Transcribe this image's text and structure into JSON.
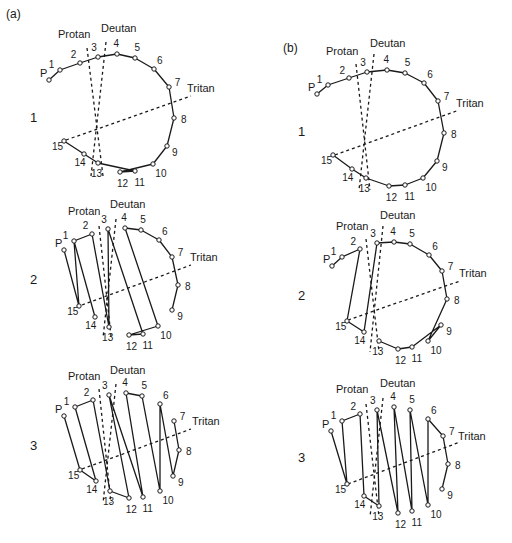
{
  "figure": {
    "panels": [
      {
        "id": "a",
        "label": "(a)",
        "label_pos": [
          6,
          18
        ],
        "plots": [
          {
            "row_label": "1",
            "row_label_pos": [
              30,
              122
            ],
            "points": {
              "P": [
                49,
                80
              ],
              "1": [
                60,
                70
              ],
              "2": [
                80,
                63
              ],
              "3": [
                98,
                57
              ],
              "4": [
                117,
                54
              ],
              "5": [
                135,
                58
              ],
              "6": [
                154,
                69
              ],
              "7": [
                169,
                87
              ],
              "8": [
                174,
                118
              ],
              "9": [
                167,
                146
              ],
              "10": [
                153,
                164
              ],
              "11": [
                135,
                171
              ],
              "12": [
                120,
                172
              ],
              "13": [
                98,
                163
              ],
              "14": [
                84,
                154
              ],
              "15": [
                64,
                141
              ]
            },
            "sequence": [
              [
                "P",
                "1",
                "2",
                "3",
                "4",
                "5",
                "6",
                "7",
                "8",
                "9",
                "10",
                "12",
                "11",
                "13",
                "14",
                "15"
              ]
            ],
            "axes": {
              "protan": [
                [
                  87,
                  48
                ],
                [
                  103,
                  176
                ]
              ],
              "deutan": [
                [
                  106,
                  42
                ],
                [
                  91,
                  176
                ]
              ],
              "tritan": [
                [
                  66,
                  140
                ],
                [
                  191,
                  96
                ]
              ]
            },
            "axis_labels": {
              "protan": [
                58,
                38
              ],
              "deutan": [
                101,
                32
              ],
              "tritan": [
                187,
                92
              ]
            }
          },
          {
            "row_label": "2",
            "row_label_pos": [
              30,
              284
            ],
            "points": {
              "P": [
                64,
                250
              ],
              "1": [
                74,
                241
              ],
              "2": [
                92,
                234
              ],
              "3": [
                108,
                229
              ],
              "4": [
                125,
                228
              ],
              "5": [
                141,
                230
              ],
              "6": [
                159,
                240
              ],
              "7": [
                172,
                257
              ],
              "8": [
                178,
                285
              ],
              "9": [
                172,
                310
              ],
              "10": [
                158,
                326
              ],
              "11": [
                143,
                334
              ],
              "12": [
                129,
                335
              ],
              "13": [
                109,
                327
              ],
              "14": [
                95,
                317
              ],
              "15": [
                79,
                306
              ]
            },
            "sequence": [
              [
                "P",
                "15",
                "1",
                "2",
                "13",
                "3",
                "11",
                "12",
                "10",
                "4",
                "5",
                "6",
                "7",
                "8",
                "9"
              ],
              [
                "1",
                "14"
              ]
            ],
            "axes": {
              "protan": [
                [
                  99,
                  226
                ],
                [
                  111,
                  336
                ]
              ],
              "deutan": [
                [
                  116,
                  219
                ],
                [
                  103,
                  338
                ]
              ],
              "tritan": [
                [
                  82,
                  305
                ],
                [
                  191,
                  265
                ]
              ]
            },
            "axis_labels": {
              "protan": [
                68,
                215
              ],
              "deutan": [
                110,
                208
              ],
              "tritan": [
                190,
                261
              ]
            }
          },
          {
            "row_label": "3",
            "row_label_pos": [
              30,
              450
            ],
            "points": {
              "P": [
                64,
                416
              ],
              "1": [
                75,
                407
              ],
              "2": [
                93,
                400
              ],
              "3": [
                109,
                395
              ],
              "4": [
                126,
                393
              ],
              "5": [
                142,
                396
              ],
              "6": [
                160,
                404
              ],
              "7": [
                174,
                421
              ],
              "8": [
                179,
                450
              ],
              "9": [
                173,
                476
              ],
              "10": [
                160,
                491
              ],
              "11": [
                143,
                497
              ],
              "12": [
                129,
                498
              ],
              "13": [
                110,
                491
              ],
              "14": [
                96,
                481
              ],
              "15": [
                80,
                470
              ]
            },
            "sequence": [
              [
                "P",
                "15",
                "14",
                "1",
                "2",
                "13",
                "12",
                "3",
                "11",
                "4",
                "5",
                "10",
                "6",
                "9",
                "8",
                "7"
              ]
            ],
            "axes": {
              "protan": [
                [
                  99,
                  389
                ],
                [
                  111,
                  503
                ]
              ],
              "deutan": [
                [
                  116,
                  384
                ],
                [
                  103,
                  503
                ]
              ],
              "tritan": [
                [
                  82,
                  469
                ],
                [
                  191,
                  429
                ]
              ]
            },
            "axis_labels": {
              "protan": [
                68,
                380
              ],
              "deutan": [
                110,
                374
              ],
              "tritan": [
                192,
                425
              ]
            }
          }
        ]
      },
      {
        "id": "b",
        "label": "(b)",
        "label_pos": [
          283,
          52
        ],
        "plots": [
          {
            "row_label": "1",
            "row_label_pos": [
              298,
              136
            ],
            "points": {
              "P": [
                317,
                94
              ],
              "1": [
                328,
                85
              ],
              "2": [
                349,
                78
              ],
              "3": [
                367,
                72
              ],
              "4": [
                387,
                70
              ],
              "5": [
                405,
                73
              ],
              "6": [
                424,
                83
              ],
              "7": [
                438,
                101
              ],
              "8": [
                444,
                133
              ],
              "9": [
                437,
                161
              ],
              "10": [
                423,
                178
              ],
              "11": [
                405,
                185
              ],
              "12": [
                389,
                186
              ],
              "13": [
                366,
                178
              ],
              "14": [
                352,
                169
              ],
              "15": [
                333,
                155
              ]
            },
            "sequence": [
              [
                "P",
                "1",
                "2",
                "3",
                "4",
                "5",
                "6",
                "7",
                "8",
                "9",
                "10",
                "11",
                "12",
                "13",
                "14",
                "15"
              ]
            ],
            "axes": {
              "protan": [
                [
                  356,
                  64
                ],
                [
                  370,
                  190
                ]
              ],
              "deutan": [
                [
                  374,
                  54
                ],
                [
                  359,
                  190
                ]
              ],
              "tritan": [
                [
                  335,
                  155
                ],
                [
                  459,
                  110
                ]
              ]
            },
            "axis_labels": {
              "protan": [
                326,
                55
              ],
              "deutan": [
                370,
                47
              ],
              "tritan": [
                456,
                107
              ]
            }
          },
          {
            "row_label": "2",
            "row_label_pos": [
              298,
              300
            ],
            "points": {
              "P": [
                332,
                266
              ],
              "1": [
                342,
                257
              ],
              "2": [
                360,
                249
              ],
              "3": [
                377,
                243
              ],
              "4": [
                394,
                242
              ],
              "5": [
                410,
                244
              ],
              "6": [
                429,
                255
              ],
              "7": [
                442,
                271
              ],
              "8": [
                447,
                299
              ],
              "9": [
                441,
                325
              ],
              "10": [
                428,
                341
              ],
              "11": [
                412,
                347
              ],
              "12": [
                398,
                349
              ],
              "13": [
                379,
                341
              ],
              "14": [
                364,
                332
              ],
              "15": [
                347,
                321
              ]
            },
            "sequence": [
              [
                "P",
                "1",
                "2",
                "15",
                "14",
                "3",
                "4",
                "5",
                "6",
                "7",
                "8",
                "10",
                "9",
                "11",
                "12",
                "13"
              ]
            ],
            "axes": {
              "protan": [
                [
                  366,
                  239
                ],
                [
                  379,
                  352
                ]
              ],
              "deutan": [
                [
                  383,
                  226
                ],
                [
                  370,
                  352
                ]
              ],
              "tritan": [
                [
                  348,
                  320
                ],
                [
                  460,
                  281
                ]
              ]
            },
            "axis_labels": {
              "protan": [
                336,
                230
              ],
              "deutan": [
                380,
                219
              ],
              "tritan": [
                459,
                277
              ]
            }
          },
          {
            "row_label": "3",
            "row_label_pos": [
              298,
              462
            ],
            "points": {
              "P": [
                331,
                431
              ],
              "1": [
                342,
                421
              ],
              "2": [
                360,
                414
              ],
              "3": [
                377,
                410
              ],
              "4": [
                394,
                407
              ],
              "5": [
                410,
                410
              ],
              "6": [
                428,
                419
              ],
              "7": [
                443,
                436
              ],
              "8": [
                448,
                464
              ],
              "9": [
                442,
                489
              ],
              "10": [
                428,
                505
              ],
              "11": [
                412,
                511
              ],
              "12": [
                398,
                513
              ],
              "13": [
                379,
                506
              ],
              "14": [
                364,
                496
              ],
              "15": [
                347,
                484
              ]
            },
            "sequence": [
              [
                "P",
                "15",
                "1",
                "2",
                "14",
                "13",
                "3",
                "12",
                "4",
                "11",
                "5",
                "10",
                "6",
                "7",
                "8",
                "9"
              ]
            ],
            "axes": {
              "protan": [
                [
                  366,
                  404
                ],
                [
                  379,
                  517
                ]
              ],
              "deutan": [
                [
                  383,
                  398
                ],
                [
                  370,
                  517
                ]
              ],
              "tritan": [
                [
                  348,
                  484
                ],
                [
                  460,
                  442
                ]
              ]
            },
            "axis_labels": {
              "protan": [
                336,
                393
              ],
              "deutan": [
                380,
                387
              ],
              "tritan": [
                458,
                440
              ]
            }
          }
        ]
      }
    ],
    "axis_names": {
      "protan": "Protan",
      "deutan": "Deutan",
      "tritan": "Tritan"
    }
  }
}
